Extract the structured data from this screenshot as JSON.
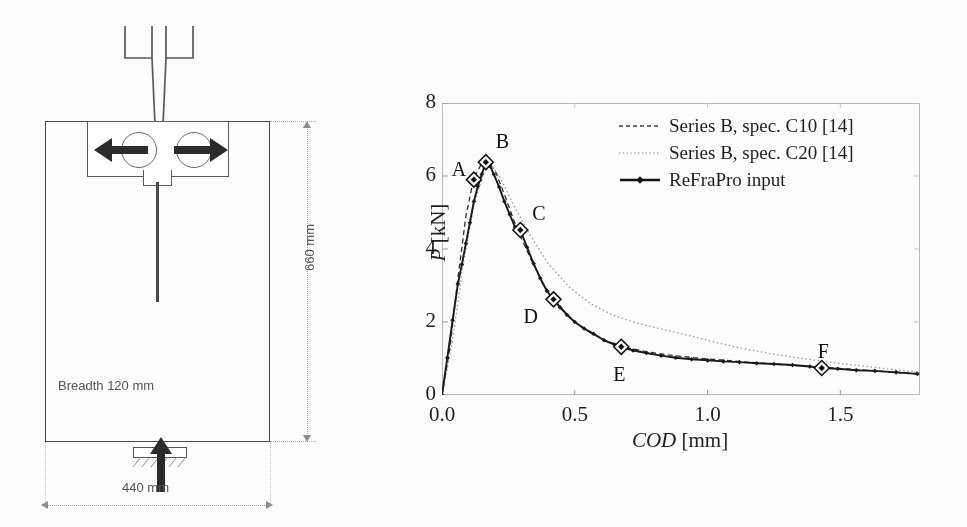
{
  "figure": {
    "panels": [
      "specimen-diagram",
      "load-cod-chart"
    ]
  },
  "specimen": {
    "title": "Wedge splitting test specimen",
    "breadth_label": "Breadth 120 mm",
    "height_label": "660 mm",
    "width_label": "440 mm",
    "arrow_left": "←",
    "arrow_right": "→",
    "load_arrow": "↑"
  },
  "chart_data": {
    "type": "line",
    "title": "",
    "xlabel": "COD [mm]",
    "ylabel": "P [kN]",
    "xlim": [
      0.0,
      1.8
    ],
    "ylim": [
      0,
      8
    ],
    "xticks": [
      "0.0",
      "0.5",
      "1.0",
      "1.5"
    ],
    "xtick_values": [
      0.0,
      0.5,
      1.0,
      1.5
    ],
    "yticks": [
      "0",
      "2",
      "4",
      "6",
      "8"
    ],
    "ytick_values": [
      0,
      2,
      4,
      6,
      8
    ],
    "grid": false,
    "legend_position": "top-right-inside",
    "series": [
      {
        "name": "Series B, spec. C10 [14]",
        "style": "dashed",
        "color": "#2f2f2f",
        "x": [
          0.0,
          0.03,
          0.06,
          0.09,
          0.12,
          0.15,
          0.17,
          0.2,
          0.24,
          0.28,
          0.33,
          0.38,
          0.44,
          0.5,
          0.56,
          0.62,
          0.68,
          0.76,
          0.85,
          0.95,
          1.05,
          1.15,
          1.25,
          1.35,
          1.45,
          1.55,
          1.65,
          1.75,
          1.8
        ],
        "values": [
          0.0,
          1.3,
          3.2,
          4.9,
          5.95,
          6.35,
          6.4,
          6.15,
          5.4,
          4.6,
          3.8,
          3.05,
          2.45,
          2.0,
          1.7,
          1.48,
          1.32,
          1.2,
          1.1,
          1.02,
          0.96,
          0.9,
          0.85,
          0.8,
          0.75,
          0.7,
          0.65,
          0.6,
          0.58
        ]
      },
      {
        "name": "Series B, spec. C20 [14]",
        "style": "dotted",
        "color": "#9a9a9a",
        "x": [
          0.0,
          0.04,
          0.08,
          0.12,
          0.16,
          0.18,
          0.22,
          0.27,
          0.33,
          0.4,
          0.48,
          0.56,
          0.64,
          0.72,
          0.8,
          0.9,
          1.0,
          1.1,
          1.2,
          1.3,
          1.4,
          1.5,
          1.58,
          1.65,
          1.72,
          1.8
        ],
        "values": [
          0.0,
          1.5,
          3.6,
          5.2,
          6.15,
          6.35,
          5.95,
          5.2,
          4.4,
          3.6,
          2.95,
          2.5,
          2.2,
          2.0,
          1.85,
          1.68,
          1.5,
          1.32,
          1.18,
          1.06,
          0.96,
          0.86,
          0.8,
          0.74,
          0.68,
          0.62
        ]
      },
      {
        "name": "ReFraPro input",
        "style": "solid-with-dots",
        "color": "#1a1a1a",
        "x": [
          0.0,
          0.02,
          0.04,
          0.06,
          0.075,
          0.09,
          0.105,
          0.12,
          0.135,
          0.15,
          0.165,
          0.18,
          0.195,
          0.215,
          0.235,
          0.255,
          0.275,
          0.295,
          0.32,
          0.345,
          0.37,
          0.395,
          0.42,
          0.445,
          0.47,
          0.5,
          0.535,
          0.57,
          0.61,
          0.65,
          0.675,
          0.72,
          0.77,
          0.825,
          0.88,
          0.94,
          1.0,
          1.06,
          1.12,
          1.185,
          1.25,
          1.32,
          1.385,
          1.43,
          1.49,
          1.56,
          1.63,
          1.71,
          1.79
        ],
        "values": [
          0.0,
          1.02,
          2.05,
          3.05,
          3.58,
          4.15,
          4.72,
          5.3,
          5.72,
          6.05,
          6.38,
          6.28,
          6.05,
          5.7,
          5.3,
          4.95,
          4.6,
          4.52,
          4.05,
          3.6,
          3.2,
          2.85,
          2.62,
          2.4,
          2.2,
          2.0,
          1.82,
          1.68,
          1.5,
          1.38,
          1.32,
          1.22,
          1.15,
          1.08,
          1.02,
          0.98,
          0.95,
          0.92,
          0.9,
          0.87,
          0.85,
          0.82,
          0.78,
          0.74,
          0.72,
          0.68,
          0.66,
          0.62,
          0.58
        ]
      }
    ],
    "annotations": [
      {
        "label": "A",
        "x": 0.12,
        "y": 5.9,
        "text_dx": -22,
        "text_dy": -22
      },
      {
        "label": "B",
        "x": 0.165,
        "y": 6.38,
        "text_dx": 10,
        "text_dy": -32
      },
      {
        "label": "C",
        "x": 0.295,
        "y": 4.52,
        "text_dx": 12,
        "text_dy": -28
      },
      {
        "label": "D",
        "x": 0.42,
        "y": 2.62,
        "text_dx": -30,
        "text_dy": 6
      },
      {
        "label": "E",
        "x": 0.675,
        "y": 1.32,
        "text_dx": -8,
        "text_dy": 16
      },
      {
        "label": "F",
        "x": 1.43,
        "y": 0.74,
        "text_dx": -4,
        "text_dy": -28
      }
    ]
  }
}
